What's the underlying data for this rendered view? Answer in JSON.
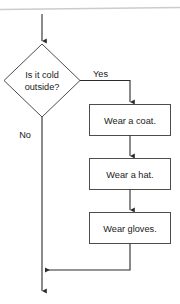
{
  "diagram": {
    "type": "flowchart",
    "background_color": "#ffffff",
    "shape_fill": "#ffffff",
    "shape_stroke": "#4d4d4d",
    "connector_color": "#2b2b2b",
    "rule_color": "#c9ccd1",
    "text_color": "#1a1a1a"
  },
  "nodes": {
    "decision": {
      "shape": "diamond",
      "line1": "Is it cold",
      "line2": "outside?"
    },
    "step1": {
      "shape": "rectangle",
      "label": "Wear a coat."
    },
    "step2": {
      "shape": "rectangle",
      "label": "Wear a hat."
    },
    "step3": {
      "shape": "rectangle",
      "label": "Wear gloves."
    }
  },
  "edges": {
    "entry": {
      "label": "",
      "from": "start",
      "to": "decision"
    },
    "yes": {
      "label": "Yes",
      "from": "decision",
      "to": "step1"
    },
    "no": {
      "label": "No",
      "from": "decision",
      "to": "merge"
    },
    "step1_to_step2": {
      "label": "",
      "from": "step1",
      "to": "step2"
    },
    "step2_to_step3": {
      "label": "",
      "from": "step2",
      "to": "step3"
    },
    "step3_to_merge": {
      "label": "",
      "from": "step3",
      "to": "merge"
    },
    "exit": {
      "label": "",
      "from": "merge",
      "to": "end"
    }
  }
}
